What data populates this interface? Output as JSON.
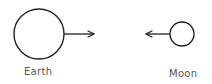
{
  "diagram": {
    "bodies": [
      {
        "name": "Earth",
        "cx": 39,
        "cy": 34,
        "r": 25,
        "arrow": {
          "from": 64,
          "to": 94,
          "direction": "right"
        }
      },
      {
        "name": "Moon",
        "cx": 182,
        "cy": 34,
        "r": 12,
        "arrow": {
          "from": 170,
          "to": 146,
          "direction": "left"
        }
      }
    ],
    "labels": {
      "earth": "Earth",
      "moon": "Moon"
    },
    "colors": {
      "stroke": "#222222",
      "text": "#555555"
    }
  }
}
